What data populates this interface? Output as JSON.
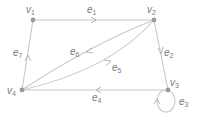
{
  "graph": {
    "vertices": [
      {
        "id": "v1",
        "label": "v",
        "sub": "1",
        "x": 33,
        "y": 20
      },
      {
        "id": "v2",
        "label": "v",
        "sub": "2",
        "x": 154,
        "y": 20
      },
      {
        "id": "v3",
        "label": "v",
        "sub": "3",
        "x": 168,
        "y": 90
      },
      {
        "id": "v4",
        "label": "v",
        "sub": "4",
        "x": 22,
        "y": 90
      }
    ],
    "edges": [
      {
        "id": "e1",
        "label": "e",
        "sub": "1",
        "from": "v1",
        "to": "v2"
      },
      {
        "id": "e2",
        "label": "e",
        "sub": "2",
        "from": "v2",
        "to": "v3"
      },
      {
        "id": "e3",
        "label": "e",
        "sub": "3",
        "from": "v3",
        "to": "v3",
        "type": "loop"
      },
      {
        "id": "e4",
        "label": "e",
        "sub": "4",
        "from": "v3",
        "to": "v4"
      },
      {
        "id": "e5",
        "label": "e",
        "sub": "5",
        "from": "v4",
        "to": "v2"
      },
      {
        "id": "e6",
        "label": "e",
        "sub": "6",
        "from": "v2",
        "to": "v4"
      },
      {
        "id": "e7",
        "label": "e",
        "sub": "7",
        "from": "v4",
        "to": "v1"
      }
    ],
    "colors": {
      "edge": "#c8c8c8",
      "vertex": "#9a9a9a",
      "label": "#7a7a7a",
      "background": "#ffffff"
    }
  }
}
